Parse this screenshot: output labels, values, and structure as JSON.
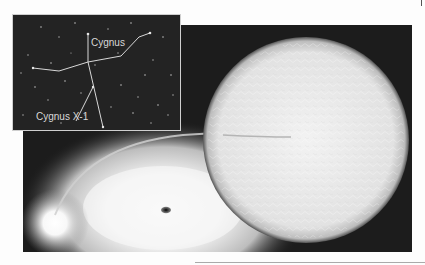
{
  "illustration": {
    "subject": "Black hole binary system: supergiant star with accretion disk around black hole",
    "inset": {
      "labels": {
        "constellation": "Cygnus",
        "object": "Cygnus X-1"
      }
    }
  },
  "colors": {
    "space": "#1c1c1c",
    "inset_bg": "#232323",
    "star": "#e8e8e8",
    "disk": "#f4f4f4",
    "black_hole": "#111111",
    "label": "#d8d8d8"
  }
}
